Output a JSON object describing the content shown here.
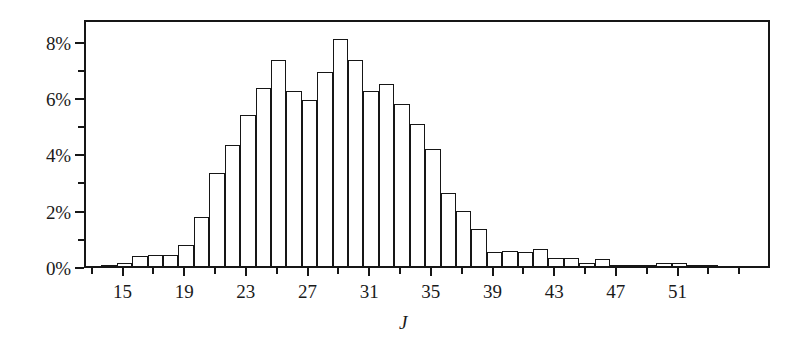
{
  "chart_data": {
    "type": "bar",
    "title": "",
    "subtitle": "",
    "xlabel": "J",
    "ylabel": "",
    "grid": false,
    "legend": null,
    "xlim": [
      12.5,
      57
    ],
    "ylim": [
      0,
      8.8
    ],
    "y_tick_labels": [
      "0%",
      "2%",
      "4%",
      "6%",
      "8%"
    ],
    "y_tick_values": [
      0,
      2,
      4,
      6,
      8
    ],
    "y_minor_tick_values": [
      1,
      3,
      5,
      7
    ],
    "x_tick_labels": [
      "15",
      "19",
      "23",
      "27",
      "31",
      "35",
      "39",
      "43",
      "47",
      "51"
    ],
    "x_tick_values": [
      15,
      19,
      23,
      27,
      31,
      35,
      39,
      43,
      47,
      51
    ],
    "x_minor_tick_values": [
      13,
      17,
      21,
      25,
      29,
      33,
      37,
      41,
      45,
      49,
      53,
      55
    ],
    "value_unit": "%",
    "bar_width": 1,
    "categories": [
      14,
      15,
      16,
      17,
      18,
      19,
      20,
      21,
      22,
      23,
      24,
      25,
      26,
      27,
      28,
      29,
      30,
      31,
      32,
      33,
      34,
      35,
      36,
      37,
      38,
      39,
      40,
      41,
      42,
      43,
      44,
      45,
      46,
      47,
      48,
      49,
      50,
      51,
      52,
      53
    ],
    "values": [
      0.05,
      0.1,
      0.35,
      0.4,
      0.4,
      0.75,
      1.75,
      3.3,
      4.3,
      5.35,
      6.3,
      7.3,
      6.2,
      5.9,
      6.9,
      8.05,
      7.3,
      6.2,
      6.45,
      5.75,
      5.05,
      4.15,
      2.6,
      1.95,
      1.3,
      0.5,
      0.55,
      0.5,
      0.6,
      0.3,
      0.3,
      0.1,
      0.25,
      0.05,
      0.05,
      0.05,
      0.1,
      0.1,
      0.05,
      0.05
    ]
  },
  "style": {
    "axis_color": "#161616",
    "bar_fill": "#ffffff",
    "bar_stroke": "#161616",
    "background": "#ffffff"
  }
}
